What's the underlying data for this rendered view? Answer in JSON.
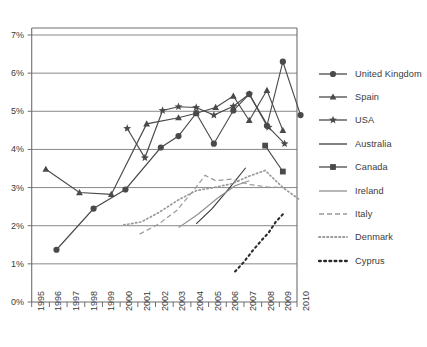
{
  "chart_data": {
    "type": "line",
    "title": "",
    "subtitle": "",
    "xlabel": "",
    "ylabel": "",
    "xlim": [
      1995,
      2010
    ],
    "ylim": [
      0,
      7
    ],
    "y_unit": "%",
    "grid": "horizontal",
    "legend_position": "right",
    "y_ticks": [
      "0%",
      "1%",
      "2%",
      "3%",
      "4%",
      "5%",
      "6%",
      "7%"
    ],
    "y_tick_values": [
      0,
      1,
      2,
      3,
      4,
      5,
      6,
      7
    ],
    "x_ticks": [
      "1995",
      "1996",
      "1997",
      "1998",
      "1999",
      "2000",
      "2001",
      "2002",
      "2003",
      "2004",
      "2005",
      "2006",
      "2007",
      "2008",
      "2009",
      "2010"
    ],
    "x_tick_values": [
      1995,
      1996,
      1997,
      1998,
      1999,
      2000,
      2001,
      2002,
      2003,
      2004,
      2005,
      2006,
      2007,
      2008,
      2009,
      2010
    ],
    "series": [
      {
        "name": "United Kingdom",
        "marker": "circle",
        "line": "solid",
        "color": "#4a4a4a",
        "points": [
          {
            "x": 1996.4,
            "y": 1.37
          },
          {
            "x": 1998.5,
            "y": 2.45
          },
          {
            "x": 2000.3,
            "y": 2.95
          },
          {
            "x": 2002.3,
            "y": 4.05
          },
          {
            "x": 2003.3,
            "y": 4.35
          },
          {
            "x": 2004.3,
            "y": 4.95
          },
          {
            "x": 2005.3,
            "y": 4.15
          },
          {
            "x": 2006.4,
            "y": 5.02
          },
          {
            "x": 2007.3,
            "y": 5.45
          },
          {
            "x": 2008.3,
            "y": 4.62
          },
          {
            "x": 2009.2,
            "y": 6.3
          },
          {
            "x": 2010.2,
            "y": 4.9
          }
        ]
      },
      {
        "name": "Spain",
        "marker": "triangle",
        "line": "solid",
        "color": "#4a4a4a",
        "points": [
          {
            "x": 1995.8,
            "y": 3.48
          },
          {
            "x": 1997.7,
            "y": 2.87
          },
          {
            "x": 1999.5,
            "y": 2.82
          },
          {
            "x": 2001.5,
            "y": 4.67
          },
          {
            "x": 2003.3,
            "y": 4.83
          },
          {
            "x": 2004.3,
            "y": 4.95
          },
          {
            "x": 2005.4,
            "y": 5.1
          },
          {
            "x": 2006.4,
            "y": 5.4
          },
          {
            "x": 2007.3,
            "y": 4.76
          },
          {
            "x": 2008.3,
            "y": 5.55
          },
          {
            "x": 2009.2,
            "y": 4.5
          }
        ]
      },
      {
        "name": "USA",
        "marker": "star",
        "line": "solid",
        "color": "#4a4a4a",
        "points": [
          {
            "x": 2000.4,
            "y": 4.55
          },
          {
            "x": 2001.4,
            "y": 3.78
          },
          {
            "x": 2002.4,
            "y": 5.02
          },
          {
            "x": 2003.3,
            "y": 5.12
          },
          {
            "x": 2004.3,
            "y": 5.1
          },
          {
            "x": 2005.3,
            "y": 4.9
          },
          {
            "x": 2006.4,
            "y": 5.13
          },
          {
            "x": 2007.3,
            "y": 5.45
          },
          {
            "x": 2008.4,
            "y": 4.58
          },
          {
            "x": 2009.3,
            "y": 4.15
          }
        ]
      },
      {
        "name": "Australia",
        "marker": "none",
        "line": "solid",
        "color": "#3c3c3c",
        "points": [
          {
            "x": 2004.3,
            "y": 2.05
          },
          {
            "x": 2005.2,
            "y": 2.45
          },
          {
            "x": 2006.2,
            "y": 3.0
          },
          {
            "x": 2007.1,
            "y": 3.52
          }
        ]
      },
      {
        "name": "Canada",
        "marker": "square",
        "line": "solid",
        "color": "#4a4a4a",
        "points": [
          {
            "x": 2008.2,
            "y": 4.1
          },
          {
            "x": 2009.2,
            "y": 3.42
          }
        ]
      },
      {
        "name": "Ireland",
        "marker": "none",
        "line": "solid",
        "color": "#8e8e8e",
        "points": [
          {
            "x": 2003.3,
            "y": 1.95
          },
          {
            "x": 2004.4,
            "y": 2.3
          },
          {
            "x": 2005.5,
            "y": 2.72
          },
          {
            "x": 2006.5,
            "y": 3.05
          },
          {
            "x": 2007.3,
            "y": 3.18
          }
        ]
      },
      {
        "name": "Italy",
        "marker": "none",
        "line": "dashed",
        "color": "#9a9a9a",
        "points": [
          {
            "x": 2001.1,
            "y": 1.78
          },
          {
            "x": 2002.2,
            "y": 2.05
          },
          {
            "x": 2003.2,
            "y": 2.4
          },
          {
            "x": 2004.2,
            "y": 2.95
          },
          {
            "x": 2004.8,
            "y": 3.32
          },
          {
            "x": 2005.4,
            "y": 3.18
          },
          {
            "x": 2006.3,
            "y": 3.22
          },
          {
            "x": 2007.3,
            "y": 3.08
          },
          {
            "x": 2008.3,
            "y": 3.02
          },
          {
            "x": 2009.2,
            "y": 3.0
          }
        ]
      },
      {
        "name": "Denmark",
        "marker": "none",
        "line": "dotted",
        "color": "#9a9a9a",
        "points": [
          {
            "x": 2000.2,
            "y": 2.02
          },
          {
            "x": 2001.2,
            "y": 2.1
          },
          {
            "x": 2002.2,
            "y": 2.35
          },
          {
            "x": 2003.3,
            "y": 2.68
          },
          {
            "x": 2004.3,
            "y": 2.92
          },
          {
            "x": 2005.3,
            "y": 3.0
          },
          {
            "x": 2006.3,
            "y": 3.1
          },
          {
            "x": 2007.3,
            "y": 3.3
          },
          {
            "x": 2008.2,
            "y": 3.45
          },
          {
            "x": 2009.2,
            "y": 3.0
          },
          {
            "x": 2010.1,
            "y": 2.7
          }
        ]
      },
      {
        "name": "Cyprus",
        "marker": "none",
        "line": "bold-dotted",
        "color": "#2a2a2a",
        "points": [
          {
            "x": 2006.5,
            "y": 0.8
          },
          {
            "x": 2007.0,
            "y": 1.05
          },
          {
            "x": 2007.5,
            "y": 1.35
          },
          {
            "x": 2008.0,
            "y": 1.62
          },
          {
            "x": 2008.4,
            "y": 1.82
          },
          {
            "x": 2008.8,
            "y": 2.1
          },
          {
            "x": 2009.2,
            "y": 2.3
          }
        ]
      }
    ]
  },
  "legend": {
    "items": [
      {
        "label": "United Kingdom",
        "key": "line-circle"
      },
      {
        "label": "Spain",
        "key": "line-triangle"
      },
      {
        "label": "USA",
        "key": "line-star"
      },
      {
        "label": "Australia",
        "key": "line-solid-dark"
      },
      {
        "label": "Canada",
        "key": "line-square"
      },
      {
        "label": "Ireland",
        "key": "line-solid-light"
      },
      {
        "label": "Italy",
        "key": "line-dashed"
      },
      {
        "label": "Denmark",
        "key": "line-dotted"
      },
      {
        "label": "Cyprus",
        "key": "line-bold-dotted"
      }
    ]
  },
  "colors": {
    "axis": "#6e6e6e",
    "grid": "#7a7a7a",
    "text": "#3a3a3a",
    "dark_series": "#4a4a4a",
    "light_series": "#9a9a9a"
  }
}
